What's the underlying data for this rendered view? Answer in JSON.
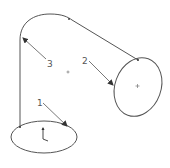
{
  "diagram": {
    "type": "cad-sweep-sketch",
    "colors": {
      "background": "#ffffff",
      "stroke": "#555555",
      "label": "#555555"
    },
    "callouts": [
      {
        "id": "1",
        "label": "1",
        "description": "leader to bottom profile ellipse"
      },
      {
        "id": "2",
        "label": "2",
        "description": "leader to end profile ellipse"
      },
      {
        "id": "3",
        "label": "3",
        "description": "leader to sweep path"
      }
    ],
    "icons": {
      "origin": "coordinate-triad-icon",
      "center": "center-point-icon"
    }
  }
}
